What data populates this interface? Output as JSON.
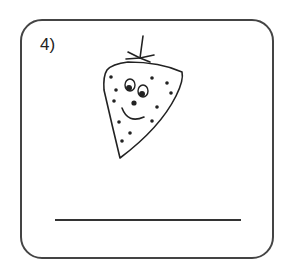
{
  "worksheet": {
    "item_number": "4)",
    "picture": "strawberry-with-face",
    "answer_line": ""
  },
  "colors": {
    "stroke": "#222222",
    "border": "#444444",
    "background": "#ffffff"
  }
}
